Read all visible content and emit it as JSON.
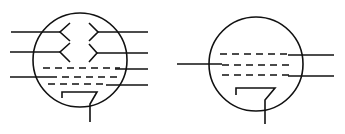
{
  "diagram": {
    "type": "vacuum-tube-schematic-symbols",
    "stroke_color": "#111111",
    "background": "#ffffff",
    "symbols": [
      {
        "id": "tube-left",
        "description": "Dual-deflection tube symbol with two pairs of deflection plates, three grids and heated cathode",
        "envelope": {
          "cx": 80,
          "cy": 60,
          "r": 47
        },
        "deflection_plates": 4,
        "grids": 3,
        "cathode": true
      },
      {
        "id": "tube-right",
        "description": "Pentode-style tube symbol with three grids and heated cathode",
        "envelope": {
          "cx": 256,
          "cy": 64,
          "r": 47
        },
        "grids": 3,
        "cathode": true
      }
    ]
  }
}
